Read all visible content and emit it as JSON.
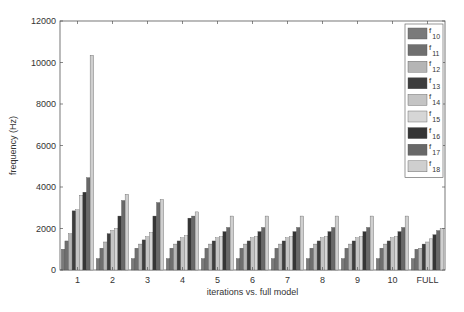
{
  "chart_data": {
    "type": "bar",
    "title": "",
    "xlabel": "iterations vs. full model",
    "ylabel": "frequency (Hz)",
    "ylim": [
      0,
      12000
    ],
    "yticks": [
      0,
      2000,
      4000,
      6000,
      8000,
      10000,
      12000
    ],
    "categories": [
      "1",
      "2",
      "3",
      "4",
      "5",
      "6",
      "7",
      "8",
      "9",
      "10",
      "FULL"
    ],
    "legend_position": "upper right",
    "grid": false,
    "series": [
      {
        "name": "f10",
        "label_base": "f",
        "label_sub": "10",
        "color": "#7a7a7a",
        "values": [
          1000,
          550,
          550,
          550,
          550,
          550,
          550,
          550,
          550,
          550,
          550
        ]
      },
      {
        "name": "f11",
        "label_base": "f",
        "label_sub": "11",
        "color": "#6f6f6f",
        "values": [
          1400,
          1050,
          1050,
          1050,
          1050,
          1050,
          1050,
          1050,
          1050,
          1050,
          1000
        ]
      },
      {
        "name": "f12",
        "label_base": "f",
        "label_sub": "12",
        "color": "#b5b5b5",
        "values": [
          1750,
          1350,
          1250,
          1250,
          1250,
          1250,
          1250,
          1250,
          1250,
          1250,
          1050
        ]
      },
      {
        "name": "f13",
        "label_base": "f",
        "label_sub": "13",
        "color": "#3d3d3d",
        "values": [
          2850,
          1750,
          1450,
          1400,
          1400,
          1400,
          1400,
          1400,
          1400,
          1400,
          1250
        ]
      },
      {
        "name": "f14",
        "label_base": "f",
        "label_sub": "14",
        "color": "#c4c4c4",
        "values": [
          2900,
          1900,
          1600,
          1550,
          1550,
          1550,
          1550,
          1550,
          1550,
          1550,
          1350
        ]
      },
      {
        "name": "f15",
        "label_base": "f",
        "label_sub": "15",
        "color": "#d6d6d6",
        "values": [
          3600,
          2000,
          1800,
          1650,
          1600,
          1600,
          1600,
          1600,
          1600,
          1600,
          1500
        ]
      },
      {
        "name": "f16",
        "label_base": "f",
        "label_sub": "16",
        "color": "#353535",
        "values": [
          3750,
          2600,
          2600,
          2500,
          1850,
          1850,
          1850,
          1850,
          1850,
          1850,
          1700
        ]
      },
      {
        "name": "f17",
        "label_base": "f",
        "label_sub": "17",
        "color": "#686868",
        "values": [
          4450,
          3350,
          3250,
          2600,
          2050,
          2050,
          2050,
          2050,
          2050,
          2050,
          1900
        ]
      },
      {
        "name": "f18",
        "label_base": "f",
        "label_sub": "18",
        "color": "#cfcfcf",
        "values": [
          10350,
          3650,
          3400,
          2800,
          2600,
          2600,
          2600,
          2600,
          2600,
          2600,
          2000
        ]
      }
    ]
  },
  "layout": {
    "plot": {
      "left": 60,
      "top": 21,
      "right": 445,
      "bottom": 270
    },
    "axis_color": "#555555",
    "bar_stroke": "#444444"
  }
}
